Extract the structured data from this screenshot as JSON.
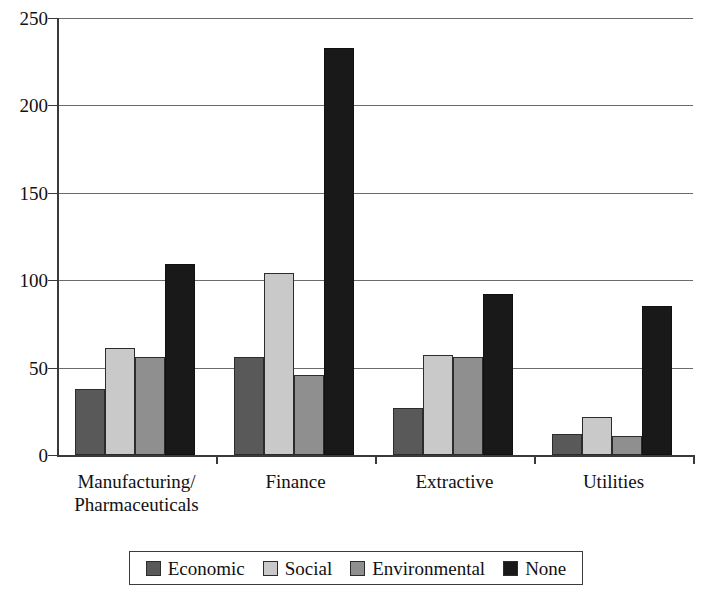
{
  "chart_data": {
    "type": "bar",
    "title": "",
    "xlabel": "",
    "ylabel": "",
    "ylim": [
      0,
      250
    ],
    "yticks": [
      0,
      50,
      100,
      150,
      200,
      250
    ],
    "ytick_labels": [
      "0",
      "50",
      "100",
      "150",
      "200",
      "250"
    ],
    "grid": true,
    "legend_position": "bottom",
    "categories": [
      "Manufacturing/ Pharmaceuticals",
      "Finance",
      "Extractive",
      "Utilities"
    ],
    "category_lines": [
      [
        "Manufacturing/",
        "Pharmaceuticals"
      ],
      [
        "Finance"
      ],
      [
        "Extractive"
      ],
      [
        "Utilities"
      ]
    ],
    "series": [
      {
        "name": "Economic",
        "color": "#595959",
        "values": [
          38,
          56,
          27,
          12
        ]
      },
      {
        "name": "Social",
        "color": "#c9c9c9",
        "values": [
          61,
          104,
          57,
          22
        ]
      },
      {
        "name": "Environmental",
        "color": "#8f8f8f",
        "values": [
          56,
          46,
          56,
          11
        ]
      },
      {
        "name": "None",
        "color": "#191919",
        "values": [
          109,
          233,
          92,
          85
        ]
      }
    ]
  },
  "legend": {
    "items": [
      {
        "label": "Economic"
      },
      {
        "label": "Social"
      },
      {
        "label": "Environmental"
      },
      {
        "label": "None"
      }
    ]
  },
  "axis": {
    "y_labels": [
      "250",
      "200",
      "150",
      "100",
      "50",
      "0"
    ]
  }
}
